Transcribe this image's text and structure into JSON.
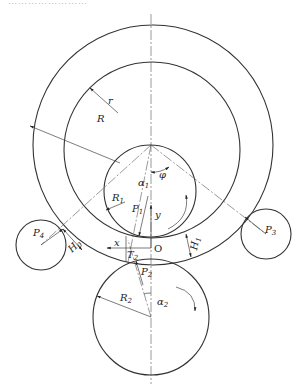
{
  "caption": "……………………",
  "diagram": {
    "labels": {
      "r": "r",
      "R": "R",
      "phi": "φ",
      "alpha1": "α",
      "alpha1_sub": "1",
      "R1": "R",
      "R1_sub": "1",
      "P1": "P",
      "P1_sub": "1",
      "y": "y",
      "x": "x",
      "O": "O",
      "H0": "H",
      "H0_sub": "0",
      "H1": "H",
      "H1_sub": "1",
      "P4": "P",
      "P4_sub": "4",
      "P3": "P",
      "P3_sub": "3",
      "T2": "T",
      "T2_sub": "2",
      "P2": "P",
      "P2_sub": "2",
      "R2": "R",
      "R2_sub": "2",
      "alpha2": "α",
      "alpha2_sub": "2"
    },
    "components": [
      {
        "name": "outer-ring-circle",
        "cx": 153,
        "cy": 145,
        "r": 120
      },
      {
        "name": "inner-ring-circle",
        "cx": 152,
        "cy": 150,
        "r": 88
      },
      {
        "name": "drive-roll-R1",
        "cx": 150,
        "cy": 191,
        "r": 46
      },
      {
        "name": "main-roll-R2",
        "cx": 151,
        "cy": 317,
        "r": 58
      },
      {
        "name": "guide-roll-P4",
        "cx": 41,
        "cy": 245,
        "r": 25
      },
      {
        "name": "guide-roll-P3",
        "cx": 266,
        "cy": 234,
        "r": 25
      }
    ]
  }
}
